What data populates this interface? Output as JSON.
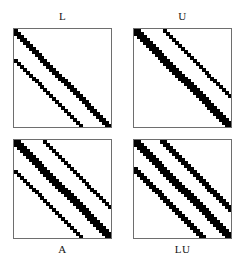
{
  "figure": {
    "title": "",
    "background_color": "#ffffff",
    "marker_color": "#000000",
    "border_color": "#6e6e6e",
    "panel_count": 4,
    "layout": "2x2"
  },
  "chart_data": {
    "type": "scatter",
    "subtype": "spy-plot-grid",
    "title": "",
    "xlabel": "",
    "ylabel": "",
    "grid": false,
    "legend": null,
    "matrix_order": 33,
    "panels": [
      {
        "id": "L",
        "label": "L",
        "label_position": "top",
        "description": "Lower triangular factor: dense main band plus one thin subdiagonal",
        "n": 33,
        "marker_color": "#000000",
        "bands": [
          {
            "name": "main-diagonal",
            "offset": 0,
            "weight": 2,
            "density": 1.0
          },
          {
            "name": "first-subdiagonal",
            "offset": -1,
            "weight": 2,
            "density": 1.0
          },
          {
            "name": "outer-subdiagonal",
            "offset": -10,
            "weight": 1,
            "density": 1.0
          }
        ]
      },
      {
        "id": "U",
        "label": "U",
        "label_position": "top",
        "description": "Upper triangular factor: dense main band plus one thin superdiagonal",
        "n": 33,
        "marker_color": "#000000",
        "bands": [
          {
            "name": "main-diagonal",
            "offset": 0,
            "weight": 2,
            "density": 1.0
          },
          {
            "name": "first-superdiagonal",
            "offset": 1,
            "weight": 2,
            "density": 1.0
          },
          {
            "name": "outer-superdiagonal",
            "offset": 10,
            "weight": 1,
            "density": 1.0
          }
        ]
      },
      {
        "id": "A",
        "label": "A",
        "label_position": "bottom",
        "description": "Original sparse matrix: pentadiagonal 5-point stencil pattern",
        "n": 33,
        "marker_color": "#000000",
        "bands": [
          {
            "name": "main-diagonal",
            "offset": 0,
            "weight": 3,
            "density": 1.0
          },
          {
            "name": "first-superdiagonal",
            "offset": 1,
            "weight": 2,
            "density": 1.0
          },
          {
            "name": "first-subdiagonal",
            "offset": -1,
            "weight": 2,
            "density": 1.0
          },
          {
            "name": "outer-superdiagonal",
            "offset": 10,
            "weight": 1,
            "density": 1.0
          },
          {
            "name": "outer-subdiagonal",
            "offset": -10,
            "weight": 1,
            "density": 1.0
          }
        ]
      },
      {
        "id": "LU",
        "label": "LU",
        "label_position": "bottom",
        "description": "Combined LU factors showing fill-in: thicker bands on all diagonals",
        "n": 33,
        "marker_color": "#000000",
        "bands": [
          {
            "name": "main-diagonal",
            "offset": 0,
            "weight": 3,
            "density": 1.0
          },
          {
            "name": "first-superdiagonal",
            "offset": 1,
            "weight": 3,
            "density": 1.0
          },
          {
            "name": "first-subdiagonal",
            "offset": -1,
            "weight": 3,
            "density": 1.0
          },
          {
            "name": "outer-superdiagonal",
            "offset": 10,
            "weight": 2,
            "density": 1.0
          },
          {
            "name": "outer-subdiagonal",
            "offset": -10,
            "weight": 2,
            "density": 1.0
          }
        ]
      }
    ]
  }
}
